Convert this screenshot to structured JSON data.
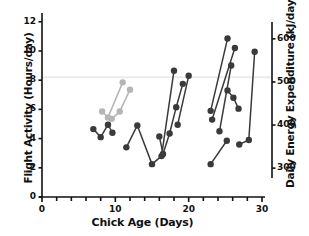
{
  "chart_data": {
    "type": "line",
    "title": "",
    "xlabel": "Chick Age (Days)",
    "ylabel": "Flight Activity (Hours/day)",
    "y2label": "Daily Energy Expenditure (kJ/day)",
    "xlim": [
      0,
      30
    ],
    "ylim": [
      0,
      12.6
    ],
    "y2lim": [
      233,
      660
    ],
    "xticks": [
      0,
      10,
      20,
      30
    ],
    "xticklabels": [
      "0",
      "10",
      "20",
      "30"
    ],
    "xminor_step": 2,
    "yticks": [
      0,
      2,
      4,
      6,
      8,
      10,
      12
    ],
    "yticklabels": [
      "0",
      "2",
      "4",
      "6",
      "8",
      "10",
      "12"
    ],
    "y2ticks": [
      300,
      400,
      500,
      600
    ],
    "y2ticklabels": [
      "300",
      "400",
      "500",
      "600"
    ],
    "grid": false,
    "legend": "none",
    "annotations": [
      {
        "name": "reference-line",
        "type": "hline",
        "y": 8.2,
        "color": "#ebebeb"
      }
    ],
    "colors": {
      "dark_series": "#3a3a3a",
      "light_series": "#b5b5b5",
      "axis": "#111111",
      "reference_line": "#ebebeb",
      "background": "#ffffff"
    },
    "series": [
      {
        "name": "chick-a-light",
        "color": "#b5b5b5",
        "marker": "circle",
        "points": [
          [
            8.2,
            5.85
          ],
          [
            9.0,
            5.45
          ],
          [
            11.0,
            7.85
          ]
        ]
      },
      {
        "name": "chick-b-light",
        "color": "#b5b5b5",
        "marker": "circle",
        "points": [
          [
            9.5,
            5.35
          ],
          [
            10.6,
            5.85
          ],
          [
            12.0,
            7.35
          ]
        ]
      },
      {
        "name": "chick-c-dark",
        "color": "#3a3a3a",
        "marker": "circle",
        "points": [
          [
            7.0,
            4.65
          ],
          [
            8.0,
            4.1
          ],
          [
            9.0,
            4.95
          ],
          [
            9.6,
            4.4
          ]
        ]
      },
      {
        "name": "chick-d-dark",
        "color": "#3a3a3a",
        "marker": "circle",
        "points": [
          [
            11.5,
            3.4
          ],
          [
            13.0,
            4.9
          ],
          [
            15.0,
            2.25
          ],
          [
            16.3,
            2.8
          ],
          [
            18.0,
            8.65
          ]
        ]
      },
      {
        "name": "chick-e-dark",
        "color": "#3a3a3a",
        "marker": "circle",
        "points": [
          [
            16.0,
            4.15
          ],
          [
            16.5,
            2.95
          ],
          [
            17.4,
            4.35
          ],
          [
            18.3,
            6.15
          ],
          [
            19.2,
            7.75
          ]
        ]
      },
      {
        "name": "chick-f-dark",
        "color": "#3a3a3a",
        "marker": "circle",
        "points": [
          [
            18.5,
            4.95
          ],
          [
            20.0,
            8.3
          ]
        ]
      },
      {
        "name": "chick-g-dark",
        "color": "#3a3a3a",
        "marker": "circle",
        "points": [
          [
            23.0,
            5.9
          ],
          [
            25.3,
            10.85
          ]
        ]
      },
      {
        "name": "chick-h-dark",
        "color": "#3a3a3a",
        "marker": "circle",
        "points": [
          [
            23.2,
            5.3
          ],
          [
            26.3,
            10.2
          ]
        ]
      },
      {
        "name": "chick-i-dark",
        "color": "#3a3a3a",
        "marker": "circle",
        "points": [
          [
            24.2,
            4.5
          ],
          [
            25.8,
            9.0
          ]
        ]
      },
      {
        "name": "chick-j-dark",
        "color": "#3a3a3a",
        "marker": "circle",
        "points": [
          [
            25.3,
            7.3
          ],
          [
            26.1,
            6.8
          ],
          [
            26.8,
            6.05
          ]
        ]
      },
      {
        "name": "chick-k-dark",
        "color": "#3a3a3a",
        "marker": "circle",
        "points": [
          [
            23.0,
            2.25
          ],
          [
            25.2,
            3.85
          ]
        ]
      },
      {
        "name": "chick-l-dark",
        "color": "#3a3a3a",
        "marker": "circle",
        "points": [
          [
            26.9,
            3.6
          ],
          [
            28.2,
            3.9
          ],
          [
            29.0,
            9.95
          ]
        ]
      }
    ]
  }
}
